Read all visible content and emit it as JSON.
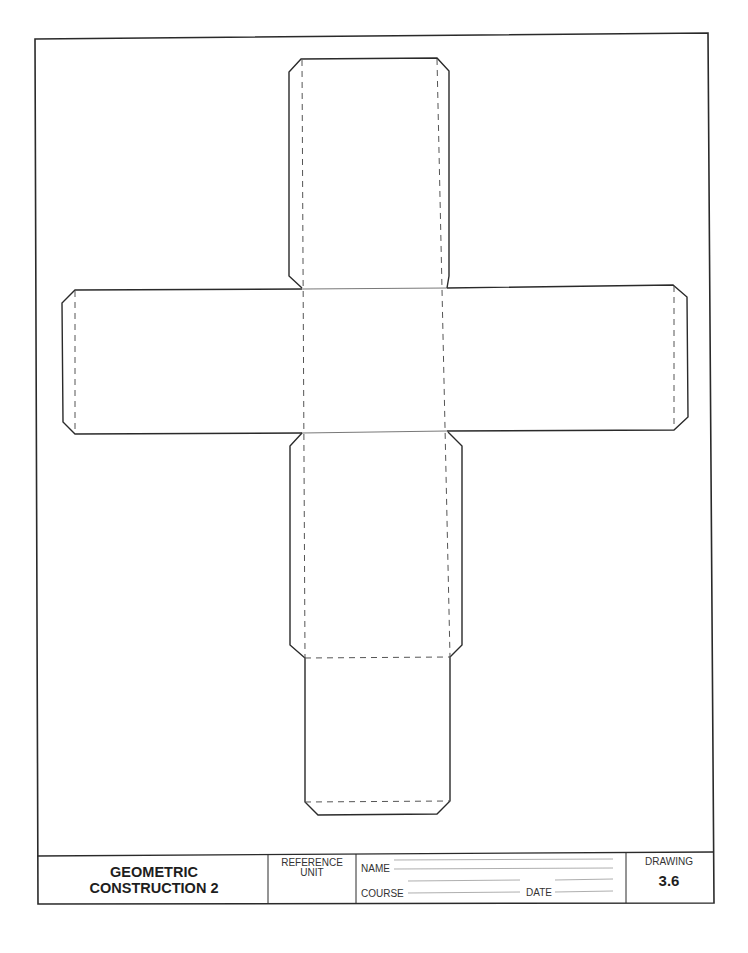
{
  "title_block": {
    "title_line1": "GEOMETRIC",
    "title_line2": "CONSTRUCTION 2",
    "reference_label_line1": "REFERENCE",
    "reference_label_line2": "UNIT",
    "reference_value": "",
    "name_label": "NAME",
    "name_value": "",
    "course_label": "COURSE",
    "course_value": "",
    "date_label": "DATE",
    "date_value": "",
    "drawing_label": "DRAWING",
    "drawing_number": "3.6"
  },
  "figure": {
    "line_color": "#2a2a2a",
    "fold_line_style": "dashed",
    "faces": 6,
    "glue_tabs": 5
  }
}
